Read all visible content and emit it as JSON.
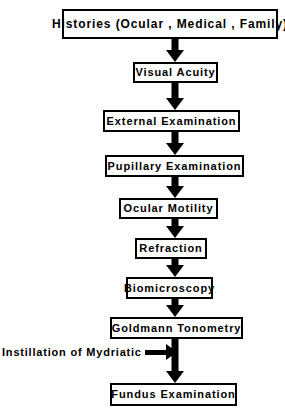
{
  "diagram": {
    "type": "vertical-flowchart",
    "accent_color": "#000000",
    "background_color": "#ffffff",
    "nodes": [
      {
        "id": "histories",
        "label": "Histories (Ocular , Medical , Family)",
        "order": 1
      },
      {
        "id": "visual-acuity",
        "label": "Visual Acuity",
        "order": 2
      },
      {
        "id": "external-examination",
        "label": "External Examination",
        "order": 3
      },
      {
        "id": "pupillary-examination",
        "label": "Pupillary Examination",
        "order": 4
      },
      {
        "id": "ocular-motility",
        "label": "Ocular Motility",
        "order": 5
      },
      {
        "id": "refraction",
        "label": "Refraction",
        "order": 6
      },
      {
        "id": "biomicroscopy",
        "label": "Biomicroscopy",
        "order": 7
      },
      {
        "id": "goldmann-tonometry",
        "label": "Goldmann Tonometry",
        "order": 8
      },
      {
        "id": "fundus-examination",
        "label": "Fundus Examination",
        "order": 9
      }
    ],
    "annotations": [
      {
        "id": "mydriatic",
        "label": "Instillation of Mydriatic",
        "direction": "right"
      }
    ]
  }
}
